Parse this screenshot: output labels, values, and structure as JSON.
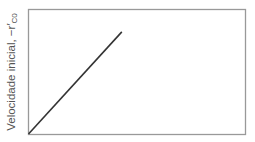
{
  "chart_data": {
    "type": "line",
    "title": "",
    "xlabel": "",
    "ylabel": "Velocidade inicial, −r′C0",
    "ylabel_parts": {
      "main": "Velocidade inicial, −r′",
      "subscript": "C0"
    },
    "grid": false,
    "legend": null,
    "x_ticks": [],
    "y_ticks": [],
    "series": [
      {
        "name": "initial rate",
        "x": [
          0,
          0.43
        ],
        "y": [
          0,
          0.82
        ],
        "color": "#333333"
      }
    ],
    "xlim": [
      0,
      1
    ],
    "ylim": [
      0,
      1
    ]
  },
  "colors": {
    "frame": "#999999",
    "line": "#333333",
    "text": "#555555"
  }
}
